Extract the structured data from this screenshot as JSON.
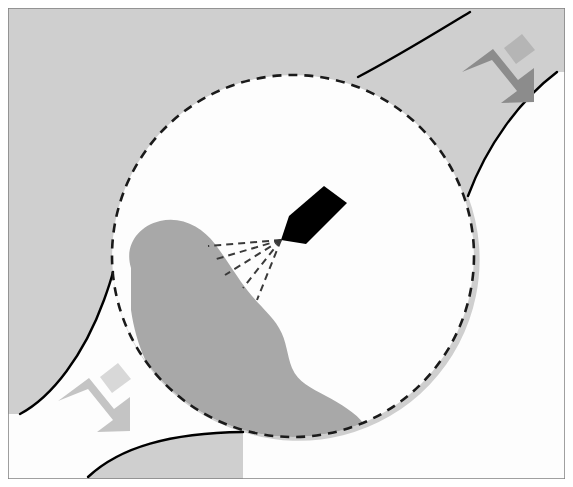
{
  "figure": {
    "title": "Spray nozzle directed at contaminant deposit within magnified inspection region",
    "type": "technical-schematic",
    "canvas": {
      "width": 573,
      "height": 487
    },
    "colors": {
      "page_background": "#ffffff",
      "panel_background": "#cfcfcf",
      "panel_border": "#808080",
      "inner_region_fill": "#fdfdfd",
      "blob_fill": "#a8a8a8",
      "nozzle_fill": "#000000",
      "contour_stroke": "#000000",
      "dashed_circle_stroke": "#1a1a1a",
      "spray_line_stroke": "#3a3a3a",
      "arrow_dark": "#8c8c8c",
      "arrow_light": "#c4c4c4",
      "arrow_dark_highlight": "#b5b5b5",
      "arrow_light_highlight": "#d8d8d8"
    },
    "panel": {
      "x": 8,
      "y": 8,
      "width": 557,
      "height": 471,
      "border_width": 1.5
    },
    "magnifier": {
      "name": "dashed-inspection-circle",
      "center_x": 293,
      "center_y": 256,
      "radius": 181,
      "stroke_width": 2.6,
      "dash_pattern": "9 7"
    },
    "blob": {
      "name": "contaminant-deposit",
      "path": "M 131 268 C 124 246 138 226 160 221 C 182 216 202 227 215 244 C 228 261 239 281 252 296 C 262 308 272 316 279 328 C 287 341 287 356 292 368 C 298 382 311 388 326 396 C 341 404 356 413 364 424 C 370 432 368 440 360 443 C 340 450 310 450 283 447 C 245 442 206 428 178 404 C 150 380 136 345 131 310 Z"
    },
    "nozzle": {
      "name": "spray-nozzle",
      "tip_x": 281,
      "tip_y": 239,
      "path": "M 281 240 L 289 216 L 324 186 L 347 203 L 306 244 Z"
    },
    "spray_lines": [
      {
        "x1": 281,
        "y1": 240,
        "x2": 208,
        "y2": 246
      },
      {
        "x1": 281,
        "y1": 240,
        "x2": 213,
        "y2": 260
      },
      {
        "x1": 281,
        "y1": 240,
        "x2": 225,
        "y2": 275
      },
      {
        "x1": 281,
        "y1": 240,
        "x2": 243,
        "y2": 288
      },
      {
        "x1": 281,
        "y1": 240,
        "x2": 257,
        "y2": 300
      }
    ],
    "contours": [
      {
        "name": "contour-top-right-upper",
        "path": "M 470 12 C 440 30 400 55 358 77"
      },
      {
        "name": "contour-right-middle",
        "path": "M 557 72 C 520 100 487 145 468 196"
      },
      {
        "name": "contour-left-lower",
        "path": "M 20 414 C 52 397 84 355 104 300 C 108 289 111 280 113 272"
      },
      {
        "name": "contour-bottom",
        "path": "M 88 477 C 120 447 170 433 243 432"
      }
    ],
    "arrows": [
      {
        "name": "arrow-top-right",
        "direction": "down-left",
        "style": "dark",
        "body_path": "M 462 72 L 493 49 L 518 80 L 534 68 L 534 102 L 501 103 L 517 91 L 492 60 Z",
        "transform": "translate(0,0)",
        "highlight_path": "M 522 34 L 535 50 L 516 64 L 504 48 Z"
      },
      {
        "name": "arrow-bottom-left",
        "direction": "down-left",
        "style": "light",
        "body_path": "M 58 401 L 89 378 L 114 409 L 130 397 L 130 431 L 97 432 L 113 420 L 88 389 Z",
        "transform": "translate(0,0)",
        "highlight_path": "M 118 363 L 131 379 L 112 393 L 100 377 Z"
      }
    ],
    "regions": [
      {
        "name": "region-outside-top-right",
        "shade": "panel_background"
      },
      {
        "name": "region-outside-bottom-left",
        "shade": "inner_region_fill"
      },
      {
        "name": "region-inside-circle",
        "shade": "inner_region_fill"
      }
    ]
  }
}
